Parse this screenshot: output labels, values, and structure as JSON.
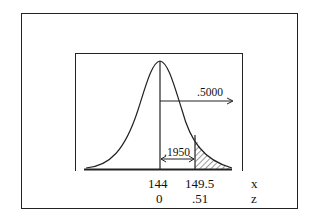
{
  "diagram": {
    "type": "normal-distribution",
    "annotations": {
      "upper_half_area": ".5000",
      "middle_area": ".1950"
    },
    "axis": {
      "x_label": "x",
      "z_label": "z",
      "x_values": [
        "144",
        "149.5"
      ],
      "z_values": [
        "0",
        ".51"
      ]
    },
    "shaded_region": "right tail beyond x = 149.5 (z = .51)"
  }
}
